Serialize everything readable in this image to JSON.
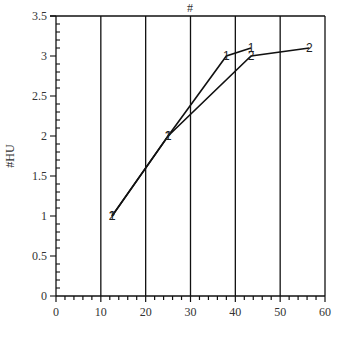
{
  "chart_data": {
    "type": "line",
    "title": "#",
    "xlabel": "",
    "ylabel": "#HU",
    "xlim": [
      0,
      60
    ],
    "ylim": [
      0,
      3.5
    ],
    "x_ticks": [
      0,
      10,
      20,
      30,
      40,
      50,
      60
    ],
    "x_tick_labels": [
      "0",
      "10",
      "20",
      "30",
      "40",
      "50",
      "60"
    ],
    "y_ticks": [
      0,
      0.5,
      1,
      1.5,
      2,
      2.5,
      3,
      3.5
    ],
    "y_tick_labels": [
      "0",
      "0.5",
      "1",
      "1.5",
      "2",
      "2.5",
      "3",
      "3.5"
    ],
    "grid": {
      "vertical_lines_at": [
        10,
        20,
        30,
        40,
        50,
        60
      ],
      "horizontal": false
    },
    "legend": null,
    "series": [
      {
        "name": "1",
        "marker_label": "1",
        "x": [
          12.5,
          25,
          38,
          43.5
        ],
        "y": [
          1,
          2,
          3,
          3.1
        ]
      },
      {
        "name": "2",
        "marker_label": "2",
        "x": [
          12.5,
          25,
          43.5,
          56.5
        ],
        "y": [
          1,
          2,
          3,
          3.1
        ]
      }
    ]
  },
  "colors": {
    "axis": "#111111",
    "line": "#111111",
    "background": "#ffffff",
    "text": "#333333"
  }
}
